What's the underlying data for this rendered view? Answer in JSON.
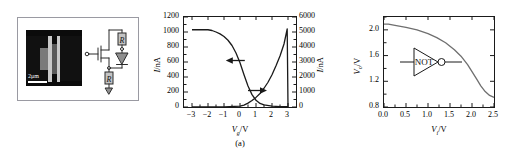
{
  "figure": {
    "caption": "(a)"
  },
  "panel_sem": {
    "scalebar_label": "2μm",
    "circuit": {
      "resistor_top_label": "R",
      "resistor_bottom_label": "R"
    }
  },
  "panel_inverter_symbol": {
    "gate_label": "NOT"
  },
  "chart_data": [
    {
      "id": "transfer-characteristics",
      "type": "line",
      "title": "",
      "xlabel": "V_g/V",
      "xlabel_parts": {
        "italic": "V",
        "sub": "g",
        "rest": "/V"
      },
      "ylabel_left": "I/nA",
      "ylabel_left_parts": {
        "italic": "I",
        "rest": "/nA"
      },
      "ylabel_right": "I/nA",
      "ylabel_right_parts": {
        "italic": "I",
        "rest": "/nA"
      },
      "xlim": [
        -3.5,
        3.5
      ],
      "xticks": [
        -3,
        -2,
        -1,
        0,
        1,
        2,
        3
      ],
      "xticklabels": [
        "−3",
        "−2",
        "−1",
        "0",
        "1",
        "2",
        "3"
      ],
      "ylim_left": [
        0,
        1200
      ],
      "yticks_left": [
        0,
        200,
        400,
        600,
        800,
        1000,
        1200
      ],
      "yticklabels_left": [
        "0",
        "200",
        "400",
        "600",
        "800",
        "1000",
        "1200"
      ],
      "ylim_right": [
        0,
        6000
      ],
      "yticks_right": [
        0,
        1000,
        2000,
        3000,
        4000,
        5000,
        6000
      ],
      "yticklabels_right": [
        "0",
        "1000",
        "2000",
        "3000",
        "4000",
        "5000",
        "6000"
      ],
      "grid": false,
      "legend": "arrows",
      "annotations": [
        {
          "name": "left-arrow",
          "points_to": "left-axis",
          "x": -0.7,
          "y_left": 620
        },
        {
          "name": "right-arrow",
          "points_to": "right-axis",
          "x": 1.5,
          "y_right": 1100
        }
      ],
      "series": [
        {
          "name": "left-axis-current",
          "axis": "left",
          "x": [
            -3.0,
            -2.0,
            -1.75,
            -1.5,
            -1.25,
            -1.0,
            -0.75,
            -0.5,
            -0.25,
            0.0,
            0.25,
            0.5,
            0.75,
            1.0,
            1.25,
            1.5,
            2.0,
            2.5,
            3.0
          ],
          "values": [
            1030,
            1030,
            1020,
            1000,
            975,
            940,
            890,
            820,
            720,
            590,
            430,
            280,
            165,
            90,
            48,
            28,
            12,
            6,
            4
          ]
        },
        {
          "name": "right-axis-current",
          "axis": "right",
          "x": [
            -3.0,
            -1.0,
            0.0,
            0.25,
            0.5,
            0.75,
            1.0,
            1.25,
            1.5,
            1.75,
            2.0,
            2.25,
            2.5,
            2.75,
            2.95,
            3.0
          ],
          "values": [
            10,
            15,
            60,
            130,
            260,
            430,
            640,
            900,
            1250,
            1650,
            2150,
            2750,
            3400,
            4200,
            5200,
            0
          ]
        }
      ]
    },
    {
      "id": "inverter-transfer",
      "type": "line",
      "title": "",
      "xlabel": "V_i/V",
      "xlabel_parts": {
        "italic": "V",
        "sub": "i",
        "rest": "/V"
      },
      "ylabel": "V_o/V",
      "ylabel_parts": {
        "italic": "V",
        "sub": "o",
        "rest": "/V"
      },
      "xlim": [
        0.0,
        2.5
      ],
      "xticks": [
        0.0,
        0.5,
        1.0,
        1.5,
        2.0,
        2.5
      ],
      "xticklabels": [
        "0.0",
        "0.5",
        "1.0",
        "1.5",
        "2.0",
        "2.5"
      ],
      "ylim": [
        0.8,
        2.2
      ],
      "yticks": [
        0.8,
        1.2,
        1.6,
        2.0
      ],
      "yticklabels": [
        "0.8",
        "1.2",
        "1.6",
        "2.0"
      ],
      "grid": false,
      "series": [
        {
          "name": "output-voltage",
          "x": [
            0.0,
            0.1,
            0.25,
            0.5,
            0.75,
            1.0,
            1.2,
            1.4,
            1.6,
            1.75,
            1.9,
            2.0,
            2.1,
            2.2,
            2.3,
            2.4,
            2.5
          ],
          "values": [
            2.09,
            2.09,
            2.07,
            2.04,
            2.0,
            1.94,
            1.88,
            1.8,
            1.69,
            1.59,
            1.46,
            1.35,
            1.24,
            1.13,
            1.04,
            0.98,
            0.95
          ]
        }
      ]
    }
  ]
}
